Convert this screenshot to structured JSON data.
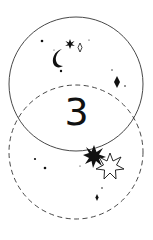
{
  "illustration": {
    "numeral": "3",
    "colors": {
      "ink": "#111111",
      "background": "#ffffff"
    },
    "circles": [
      {
        "name": "solid-circle",
        "cx": 76,
        "cy": 84,
        "r": 67,
        "style": "solid"
      },
      {
        "name": "dashed-circle",
        "cx": 76,
        "cy": 152,
        "r": 67,
        "style": "dashed"
      }
    ],
    "decorations": [
      "crescent-moon",
      "small-starburst",
      "outline-diamond",
      "filled-diamond",
      "large-filled-starburst",
      "large-outline-star",
      "small-diamond",
      "dots"
    ]
  }
}
